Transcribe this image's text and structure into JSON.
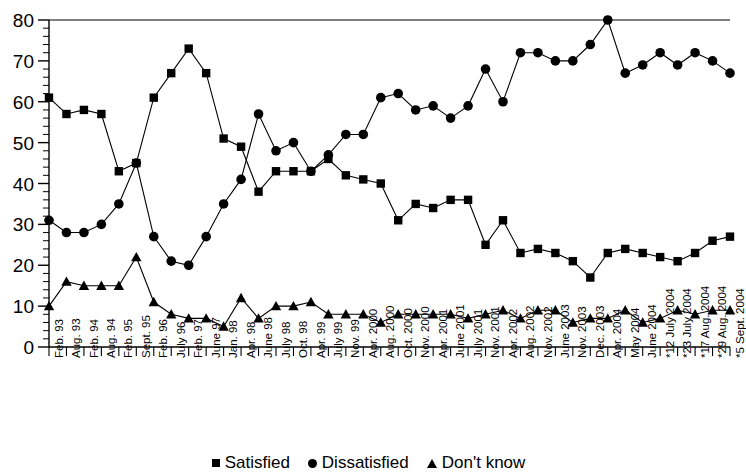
{
  "chart_data": {
    "type": "line",
    "title": "",
    "subtitle": "",
    "xlabel": "",
    "ylabel": "",
    "ylim": [
      0,
      80
    ],
    "yticks": [
      0,
      10,
      20,
      30,
      40,
      50,
      60,
      70,
      80
    ],
    "minor_tick_step": 2,
    "grid": false,
    "legend_position": "bottom",
    "categories": [
      "Feb. 93",
      "Aug. 93",
      "Feb. 94",
      "Aug. 94",
      "Feb. 95",
      "Sept. 95",
      "Feb. 96",
      "July 96",
      "Feb. 97",
      "June 97",
      "Jan. 98",
      "Apr. 98",
      "June 98",
      "July 98",
      "Oct. 98",
      "Apr. 99",
      "July 99",
      "Nov. 99",
      "Apr. 2000",
      "Aug. 2000",
      "Oct. 2000",
      "Nov. 2000",
      "Apr. 2001",
      "June 2001",
      "July 2001",
      "Nov. 2001",
      "Apr. 2002",
      "Aug. 2002",
      "Nov. 2002",
      "June 2003",
      "Nov. 2003",
      "Dec. 2003",
      "Apr. 2004",
      "May 2004",
      "June 2004",
      "*12 July 2004",
      "*23 July 2004",
      "*17 Aug. 2004",
      "*29 Aug. 2004",
      "*5 Sept. 2004"
    ],
    "series": [
      {
        "name": "Satisfied",
        "marker": "square",
        "color": "#000000",
        "values": [
          61,
          57,
          58,
          57,
          43,
          45,
          61,
          67,
          73,
          67,
          51,
          49,
          38,
          43,
          43,
          43,
          46,
          42,
          41,
          40,
          31,
          35,
          34,
          36,
          36,
          25,
          31,
          23,
          24,
          23,
          21,
          17,
          23,
          24,
          23,
          22,
          21,
          23,
          26,
          27
        ]
      },
      {
        "name": "Dissatisfied",
        "marker": "circle",
        "color": "#000000",
        "values": [
          31,
          28,
          28,
          30,
          35,
          45,
          27,
          21,
          20,
          27,
          35,
          41,
          57,
          48,
          50,
          43,
          47,
          52,
          52,
          61,
          62,
          58,
          59,
          56,
          59,
          68,
          60,
          72,
          72,
          70,
          70,
          74,
          80,
          67,
          69,
          72,
          69,
          72,
          70,
          67
        ]
      },
      {
        "name": "Don't know",
        "marker": "triangle",
        "color": "#000000",
        "values": [
          10,
          16,
          15,
          15,
          15,
          22,
          11,
          8,
          7,
          7,
          5,
          12,
          7,
          10,
          10,
          11,
          8,
          8,
          8,
          6,
          8,
          8,
          8,
          8,
          7,
          8,
          9,
          7,
          9,
          9,
          6,
          7,
          7,
          9,
          6,
          7,
          9,
          8,
          9,
          9
        ]
      }
    ]
  },
  "legend": {
    "items": [
      {
        "marker": "square-marker",
        "label": "Satisfied"
      },
      {
        "marker": "circle-marker",
        "label": "Dissatisfied"
      },
      {
        "marker": "triangle-marker",
        "label": "Don't know"
      }
    ]
  }
}
